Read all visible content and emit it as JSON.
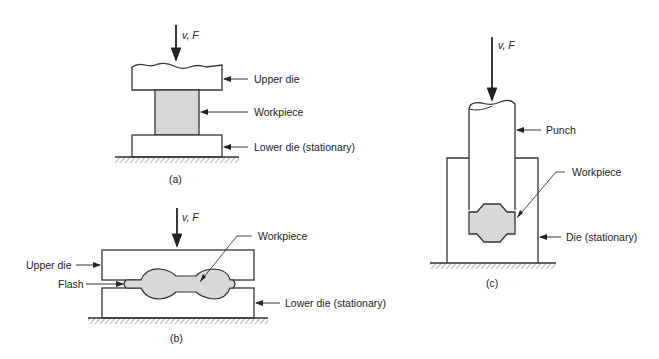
{
  "figure": {
    "panels": [
      {
        "id": "a",
        "caption": "(a)",
        "force_label": "v, F",
        "labels": {
          "upper_die": "Upper die",
          "workpiece": "Workpiece",
          "lower_die": "Lower die (stationary)"
        }
      },
      {
        "id": "b",
        "caption": "(b)",
        "force_label": "v, F",
        "labels": {
          "workpiece": "Workpiece",
          "upper_die": "Upper die",
          "flash": "Flash",
          "lower_die": "Lower die (stationary)"
        }
      },
      {
        "id": "c",
        "caption": "(c)",
        "force_label": "v, F",
        "labels": {
          "punch": "Punch",
          "workpiece": "Workpiece",
          "die": "Die (stationary)"
        }
      }
    ],
    "colors": {
      "line": "#333333",
      "workpiece_fill": "#d8d8d8",
      "background": "#ffffff"
    }
  }
}
